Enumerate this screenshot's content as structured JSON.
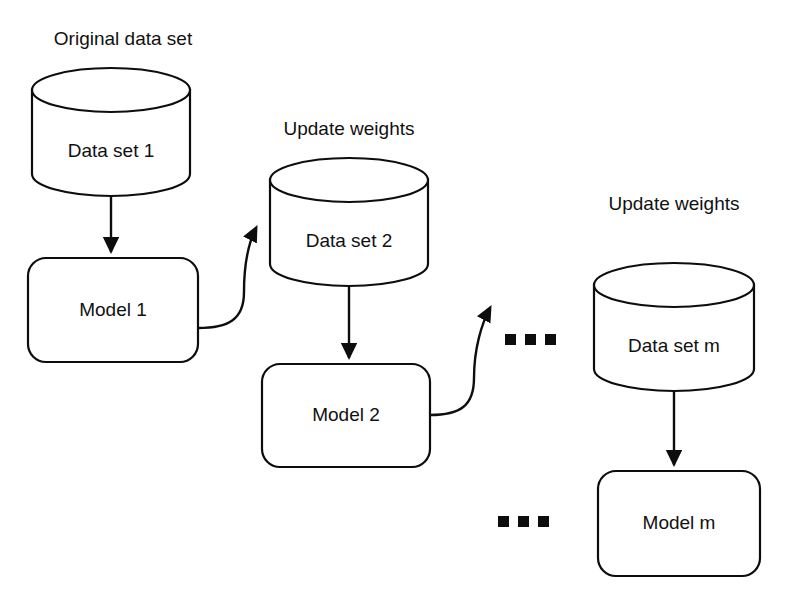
{
  "diagram": {
    "background_color": "#ffffff",
    "stroke_color": "#0d0d0d",
    "captions": [
      {
        "id": "caption-original-data-set",
        "label": "Original data set",
        "x": 123,
        "y": 40
      },
      {
        "id": "caption-update-weights-1",
        "label": "Update weights",
        "x": 349,
        "y": 130
      },
      {
        "id": "caption-update-weights-2",
        "label": "Update weights",
        "x": 674,
        "y": 205
      }
    ],
    "datasets": [
      {
        "id": "data-set-1",
        "label": "Data set 1",
        "cx": 111,
        "top": 68,
        "bottom": 196,
        "rx": 79,
        "ry": 22,
        "text_y": 152
      },
      {
        "id": "data-set-2",
        "label": "Data set 2",
        "cx": 349,
        "top": 158,
        "bottom": 286,
        "rx": 79,
        "ry": 22,
        "text_y": 242
      },
      {
        "id": "data-set-m",
        "label": "Data set m",
        "cx": 674,
        "top": 263,
        "bottom": 391,
        "rx": 80,
        "ry": 22,
        "text_y": 347
      }
    ],
    "models": [
      {
        "id": "model-1",
        "label": "Model 1",
        "x": 28,
        "y": 258,
        "w": 170,
        "h": 104,
        "r": 18
      },
      {
        "id": "model-2",
        "label": "Model 2",
        "x": 262,
        "y": 364,
        "w": 168,
        "h": 103,
        "r": 18
      },
      {
        "id": "model-m",
        "label": "Model m",
        "x": 598,
        "y": 471,
        "w": 162,
        "h": 105,
        "r": 18
      }
    ],
    "straight_arrows": [
      {
        "id": "arrow-dataset1-to-model1",
        "from": "data-set-1",
        "to": "model-1",
        "x": 111,
        "y1": 196,
        "y2": 256
      },
      {
        "id": "arrow-dataset2-to-model2",
        "from": "data-set-2",
        "to": "model-2",
        "x": 349,
        "y1": 286,
        "y2": 362
      },
      {
        "id": "arrow-datasetm-to-modelm",
        "from": "data-set-m",
        "to": "model-m",
        "x": 674,
        "y1": 391,
        "y2": 469
      }
    ],
    "curved_arrows": [
      {
        "id": "curve-model1-to-dataset2",
        "from": "model-1",
        "to": "data-set-2"
      },
      {
        "id": "curve-model2-to-ellipsis",
        "from": "model-2",
        "to": "ellipsis-middle"
      }
    ],
    "ellipses": [
      {
        "id": "ellipsis-middle",
        "label": "...",
        "cx": 524,
        "cy": 340,
        "dots": 3
      },
      {
        "id": "ellipsis-lower",
        "label": "...",
        "cx": 518,
        "cy": 521,
        "dots": 3
      }
    ]
  }
}
